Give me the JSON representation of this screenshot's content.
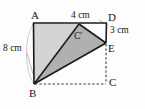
{
  "figure": {
    "type": "geometry-diagram",
    "canvas": {
      "width": 145,
      "height": 109
    },
    "colors": {
      "background": "#fdfdfd",
      "stroke": "#1a1a1a",
      "flap_fill": "#d4d4d4",
      "triangle_fill": "#b0b0b0",
      "dashed_stroke": "#3a3a3a",
      "arc_stroke": "#b4b4b4",
      "leader_stroke": "#9a9a9a",
      "text": "#171717"
    },
    "vertices": [
      {
        "id": "A",
        "label": "A",
        "x": 33,
        "y": 23,
        "label_x": 31,
        "label_y": 10
      },
      {
        "id": "D",
        "label": "D",
        "x": 107,
        "y": 23,
        "label_x": 108,
        "label_y": 12
      },
      {
        "id": "C",
        "label": "C",
        "x": 107,
        "y": 84,
        "label_x": 109,
        "label_y": 79
      },
      {
        "id": "B",
        "label": "B",
        "x": 34,
        "y": 84,
        "label_x": 29,
        "label_y": 88
      },
      {
        "id": "Cp",
        "label": "C'",
        "x": 79,
        "y": 24,
        "label_x": 74,
        "label_y": 32
      },
      {
        "id": "E",
        "label": "E",
        "x": 106,
        "y": 43,
        "label_x": 108,
        "label_y": 45
      }
    ],
    "dimensions": [
      {
        "id": "ab",
        "label": "8 cm",
        "measures": "AB",
        "x": 3,
        "y": 44
      },
      {
        "id": "cd",
        "label": "4 cm",
        "measures": "C'D",
        "x": 71,
        "y": 11
      },
      {
        "id": "de",
        "label": "3 cm",
        "measures": "DE",
        "x": 110,
        "y": 27
      }
    ],
    "regions": [
      {
        "id": "flap",
        "name": "folded-flap-ACprimeEB",
        "points": "33,23 79,24 106,43 34,84",
        "fill": "#d4d4d4"
      },
      {
        "id": "triangle",
        "name": "triangle-BCprimeE",
        "points": "34,84 79,24 106,43",
        "fill": "#b0b0b0"
      }
    ],
    "solid_edges": [
      {
        "id": "AD",
        "from": "A",
        "to": "D"
      },
      {
        "id": "AB",
        "from": "A",
        "to": "B"
      },
      {
        "id": "DE",
        "from": "D",
        "to": "E"
      },
      {
        "id": "BCp",
        "from": "B",
        "to": "Cp"
      },
      {
        "id": "CpE",
        "from": "Cp",
        "to": "E"
      },
      {
        "id": "BE",
        "from": "B",
        "to": "E"
      }
    ],
    "dashed_edges": [
      {
        "id": "BC",
        "from": "B",
        "to": "C"
      },
      {
        "id": "EC",
        "from": "E",
        "to": "C"
      }
    ],
    "annotations": {
      "arc": {
        "name": "fold-arc-A-to-B",
        "description": "faint arc from A to B on the left"
      },
      "leader": {
        "name": "leader-line-8cm",
        "description": "thin leader from 8 cm label to side AB"
      }
    }
  }
}
